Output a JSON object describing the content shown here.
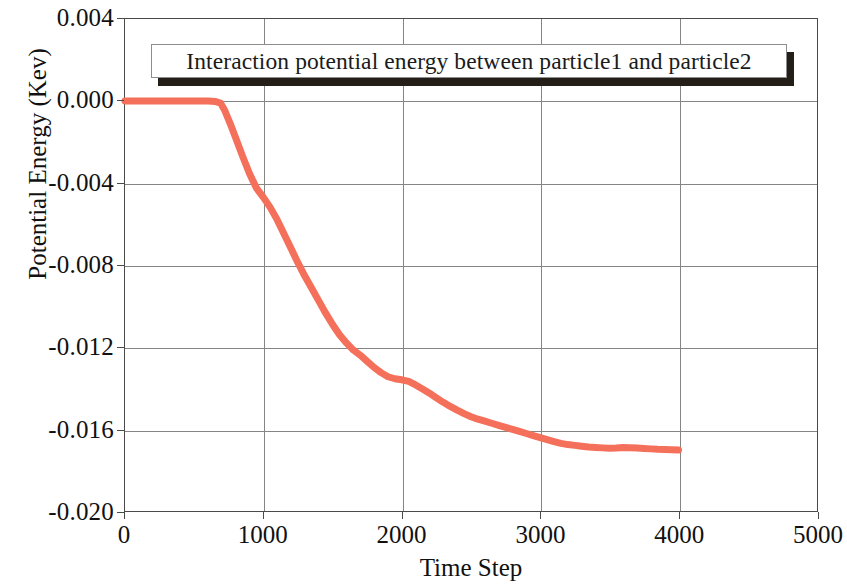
{
  "chart_data": {
    "type": "line",
    "title": "Interaction potential energy between particle1 and particle2",
    "xlabel": "Time Step",
    "ylabel": "Potential Energy (Kev)",
    "xlim": [
      0,
      5000
    ],
    "ylim": [
      -0.02,
      0.004
    ],
    "xticks": [
      "0",
      "1000",
      "2000",
      "3000",
      "4000",
      "5000"
    ],
    "xtick_values": [
      0,
      1000,
      2000,
      3000,
      4000,
      5000
    ],
    "yticks": [
      "0.004",
      "0.000",
      "-0.004",
      "-0.008",
      "-0.012",
      "-0.016",
      "-0.020"
    ],
    "ytick_values": [
      0.004,
      0.0,
      -0.004,
      -0.008,
      -0.012,
      -0.016,
      -0.02
    ],
    "grid": true,
    "legend": "none",
    "series": [
      {
        "name": "Interaction potential energy",
        "color": "#F4705A",
        "line_width": 7,
        "x": [
          0,
          100,
          200,
          300,
          400,
          500,
          600,
          650,
          690,
          720,
          760,
          800,
          850,
          900,
          950,
          1000,
          1050,
          1100,
          1150,
          1200,
          1250,
          1300,
          1350,
          1400,
          1450,
          1500,
          1550,
          1600,
          1650,
          1700,
          1750,
          1800,
          1850,
          1900,
          1950,
          2000,
          2050,
          2100,
          2150,
          2200,
          2250,
          2300,
          2350,
          2400,
          2450,
          2500,
          2550,
          2600,
          2650,
          2700,
          2750,
          2800,
          2850,
          2900,
          2950,
          3000,
          3050,
          3100,
          3150,
          3200,
          3250,
          3300,
          3350,
          3400,
          3450,
          3500,
          3550,
          3600,
          3650,
          3700,
          3750,
          3800,
          3850,
          3900,
          3950,
          4000
        ],
        "y": [
          0.0,
          0.0,
          0.0,
          0.0,
          0.0,
          0.0,
          0.0,
          -2e-05,
          -0.0001,
          -0.00045,
          -0.0011,
          -0.0018,
          -0.0027,
          -0.00355,
          -0.00425,
          -0.0047,
          -0.0052,
          -0.0058,
          -0.0065,
          -0.0072,
          -0.0079,
          -0.00855,
          -0.00915,
          -0.00975,
          -0.01035,
          -0.0109,
          -0.0114,
          -0.0118,
          -0.01215,
          -0.0124,
          -0.0127,
          -0.013,
          -0.01325,
          -0.01345,
          -0.01355,
          -0.0136,
          -0.01368,
          -0.01385,
          -0.01405,
          -0.01425,
          -0.01448,
          -0.0147,
          -0.0149,
          -0.01508,
          -0.01525,
          -0.0154,
          -0.01552,
          -0.01562,
          -0.01572,
          -0.01582,
          -0.01592,
          -0.01602,
          -0.01612,
          -0.01622,
          -0.01632,
          -0.01642,
          -0.01652,
          -0.01662,
          -0.0167,
          -0.01676,
          -0.0168,
          -0.01684,
          -0.01688,
          -0.0169,
          -0.01692,
          -0.01694,
          -0.01693,
          -0.0169,
          -0.01691,
          -0.01693,
          -0.01695,
          -0.01697,
          -0.01699,
          -0.017,
          -0.01701,
          -0.01702
        ]
      }
    ]
  }
}
